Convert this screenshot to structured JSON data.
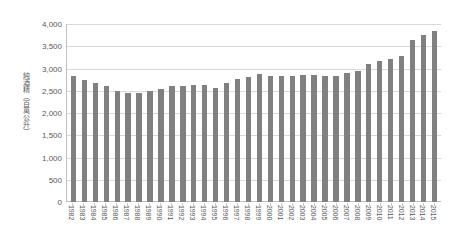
{
  "chart_data": {
    "type": "bar",
    "title": "",
    "xlabel": "",
    "ylabel": "純酒精（百萬公升）",
    "ylim": [
      0,
      4000
    ],
    "ytick_values": [
      0,
      500,
      1000,
      1500,
      2000,
      2500,
      3000,
      3500,
      4000
    ],
    "ytick_labels": [
      "0",
      "500",
      "1,000",
      "1,500",
      "2,000",
      "2,500",
      "3,000",
      "3,500",
      "4,000"
    ],
    "grid": true,
    "legend": "none",
    "bar_color": "#808080",
    "gridline_color": "#d9d9d9",
    "axis_color": "#bfbfbf",
    "text_color": "#595959",
    "background_color": "#ffffff",
    "categories": [
      "1982",
      "1983",
      "1984",
      "1985",
      "1986",
      "1987",
      "1988",
      "1989",
      "1990",
      "1991",
      "1992",
      "1993",
      "1994",
      "1995",
      "1996",
      "1997",
      "1998",
      "1999",
      "2000",
      "2001",
      "2002",
      "2003",
      "2004",
      "2005",
      "2006",
      "2007",
      "2008",
      "2009",
      "2010",
      "2011",
      "2012",
      "2013",
      "2014",
      "2015"
    ],
    "values": [
      2830,
      2740,
      2670,
      2600,
      2490,
      2440,
      2440,
      2490,
      2550,
      2600,
      2610,
      2630,
      2640,
      2570,
      2670,
      2760,
      2820,
      2870,
      2830,
      2840,
      2840,
      2860,
      2850,
      2840,
      2830,
      2900,
      2950,
      3100,
      3180,
      3220,
      3280,
      3650,
      3760,
      3850
    ]
  }
}
